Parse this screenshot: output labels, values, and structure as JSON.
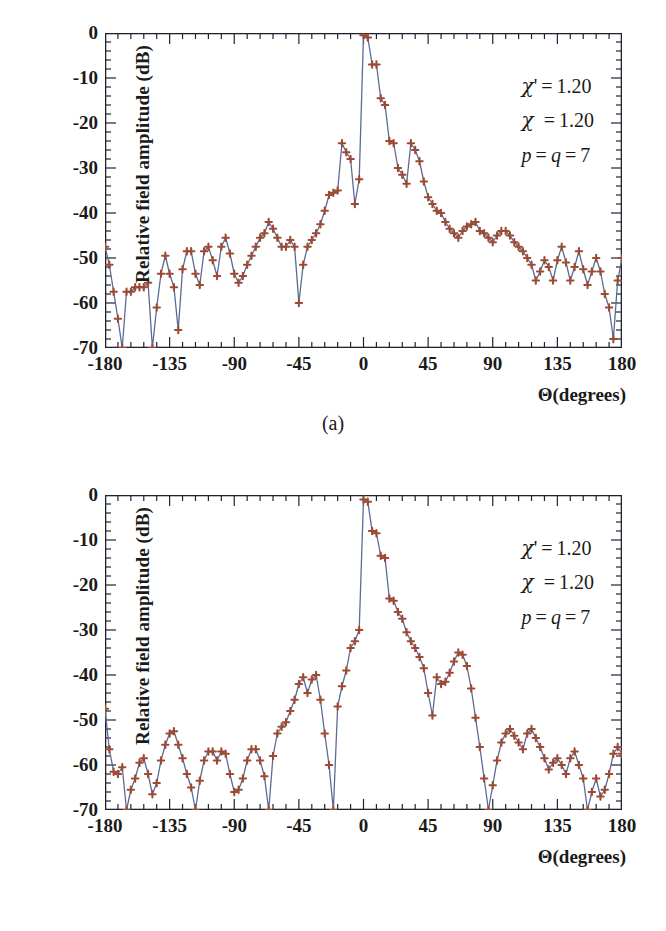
{
  "figure": {
    "axis": {
      "ylabel": "Relative field amplitude (dB)",
      "xlabel": "Θ(degrees)",
      "yticks": [
        "0",
        "-10",
        "-20",
        "-30",
        "-40",
        "-50",
        "-60",
        "-70"
      ],
      "ytick_values": [
        0,
        -10,
        -20,
        -30,
        -40,
        -50,
        -60,
        -70
      ],
      "xticks": [
        "-180",
        "-135",
        "-90",
        "-45",
        "0",
        "45",
        "90",
        "135",
        "180"
      ],
      "xtick_values": [
        -180,
        -135,
        -90,
        -45,
        0,
        45,
        90,
        135,
        180
      ],
      "ylim": [
        -70,
        0
      ],
      "xlim": [
        -180,
        180
      ],
      "y_minor_step": 2,
      "x_minor_step": 9
    },
    "style": {
      "marker_color": "#9c4a33",
      "line_color": "#5a6b96",
      "frame_color": "#1f2430",
      "background": "#ffffff"
    },
    "panels": [
      {
        "id": "a",
        "caption": "(a)",
        "annotations": [
          "χ' = 1.20",
          "χ  = 1.20",
          "p = q = 7"
        ],
        "annotation_parts": [
          {
            "sym": "χ'",
            "eq": "=",
            "val": "1.20"
          },
          {
            "sym": "χ ",
            "eq": "=",
            "val": "1.20"
          },
          {
            "sym": "p = q",
            "eq": "=",
            "val": "7"
          }
        ]
      },
      {
        "id": "b",
        "caption": "(b)",
        "annotations": [
          "χ' = 1.20",
          "χ  = 1.20",
          "p = q = 7"
        ],
        "annotation_parts": [
          {
            "sym": "χ'",
            "eq": "=",
            "val": "1.20"
          },
          {
            "sym": "χ ",
            "eq": "=",
            "val": "1.20"
          },
          {
            "sym": "p = q",
            "eq": "=",
            "val": "7"
          }
        ]
      }
    ]
  },
  "chart_data": [
    {
      "type": "line",
      "id": "panel-a",
      "title": "",
      "subtitle": "(a)",
      "xlabel": "Θ(degrees)",
      "ylabel": "Relative field amplitude (dB)",
      "xlim": [
        -180,
        180
      ],
      "ylim": [
        -70,
        0
      ],
      "grid": false,
      "legend": null,
      "markers": "plus",
      "annotations": [
        "χ' = 1.20",
        "χ = 1.20",
        "p = q = 7"
      ],
      "x": [
        -180,
        -177,
        -174,
        -171,
        -168,
        -165,
        -162,
        -159,
        -156,
        -153,
        -150,
        -147,
        -144,
        -141,
        -138,
        -135,
        -132,
        -129,
        -126,
        -123,
        -120,
        -117,
        -114,
        -111,
        -108,
        -105,
        -102,
        -99,
        -96,
        -93,
        -90,
        -87,
        -84,
        -81,
        -78,
        -75,
        -72,
        -69,
        -66,
        -63,
        -60,
        -57,
        -54,
        -51,
        -48,
        -45,
        -42,
        -39,
        -36,
        -33,
        -30,
        -27,
        -24,
        -21,
        -18,
        -15,
        -12,
        -9,
        -6,
        -3,
        0,
        3,
        6,
        9,
        12,
        15,
        18,
        21,
        24,
        27,
        30,
        33,
        36,
        39,
        42,
        45,
        48,
        51,
        54,
        57,
        60,
        63,
        66,
        69,
        72,
        75,
        78,
        81,
        84,
        87,
        90,
        93,
        96,
        99,
        102,
        105,
        108,
        111,
        114,
        117,
        120,
        123,
        126,
        129,
        132,
        135,
        138,
        141,
        144,
        147,
        150,
        153,
        156,
        159,
        162,
        165,
        168,
        171,
        174,
        177,
        180
      ],
      "y": [
        -47.5,
        -51.5,
        -57.5,
        -63.5,
        -70,
        -57.5,
        -57.5,
        -56.5,
        -56.5,
        -56.5,
        -55.5,
        -70,
        -61,
        -53.5,
        -49.5,
        -53.5,
        -56.5,
        -66,
        -52.5,
        -48.5,
        -48.5,
        -53.5,
        -56,
        -48.5,
        -47.5,
        -50.5,
        -54,
        -47.5,
        -45.5,
        -49,
        -53.5,
        -55.5,
        -54,
        -51.5,
        -49.5,
        -47.5,
        -45.5,
        -44.5,
        -42,
        -43.5,
        -45.5,
        -47.5,
        -47.5,
        -46,
        -47.5,
        -60,
        -51.5,
        -47.5,
        -46,
        -44.5,
        -42.5,
        -39.5,
        -36,
        -35.5,
        -35,
        -24.5,
        -26.5,
        -28,
        -38,
        -32.5,
        -0.5,
        -1,
        -7,
        -7,
        -14.5,
        -16,
        -24,
        -24.5,
        -30,
        -31.5,
        -33.5,
        -24.5,
        -26,
        -28.5,
        -33,
        -36.5,
        -38,
        -39.5,
        -40,
        -42,
        -43.5,
        -44.5,
        -45.5,
        -44,
        -43,
        -42.5,
        -42,
        -44,
        -44.5,
        -45.5,
        -46.5,
        -45,
        -44,
        -44,
        -45,
        -46.5,
        -47.5,
        -48.5,
        -50,
        -51.5,
        -55,
        -53,
        -50.5,
        -52,
        -55,
        -50.5,
        -47.5,
        -51,
        -55,
        -52,
        -48.5,
        -52.5,
        -56,
        -53,
        -50,
        -53,
        -58,
        -61,
        -68,
        -55,
        -50,
        -47.5
      ],
      "note": "Panel (a): main lobe peak 0 dB at 0°; first sidelobes about -24 dB near ±15-20°; far sidelobes oscillate between about -42 and -60 dB; deep nulls reach -70 dB near ±168° and -147°."
    },
    {
      "type": "line",
      "id": "panel-b",
      "title": "",
      "subtitle": "(b)",
      "xlabel": "Θ(degrees)",
      "ylabel": "Relative field amplitude (dB)",
      "xlim": [
        -180,
        180
      ],
      "ylim": [
        -70,
        0
      ],
      "grid": false,
      "legend": null,
      "markers": "plus",
      "annotations": [
        "χ' = 1.20",
        "χ = 1.20",
        "p = q = 7"
      ],
      "x": [
        -180,
        -177,
        -174,
        -171,
        -168,
        -165,
        -162,
        -159,
        -156,
        -153,
        -150,
        -147,
        -144,
        -141,
        -138,
        -135,
        -132,
        -129,
        -126,
        -123,
        -120,
        -117,
        -114,
        -111,
        -108,
        -105,
        -102,
        -99,
        -96,
        -93,
        -90,
        -87,
        -84,
        -81,
        -78,
        -75,
        -72,
        -69,
        -66,
        -63,
        -60,
        -57,
        -54,
        -51,
        -48,
        -45,
        -42,
        -39,
        -36,
        -33,
        -30,
        -27,
        -24,
        -21,
        -18,
        -15,
        -12,
        -9,
        -6,
        -3,
        0,
        3,
        6,
        9,
        12,
        15,
        18,
        21,
        24,
        27,
        30,
        33,
        36,
        39,
        42,
        45,
        48,
        51,
        54,
        57,
        60,
        63,
        66,
        69,
        72,
        75,
        78,
        81,
        84,
        87,
        90,
        93,
        96,
        99,
        102,
        105,
        108,
        111,
        114,
        117,
        120,
        123,
        126,
        129,
        132,
        135,
        138,
        141,
        144,
        147,
        150,
        153,
        156,
        159,
        162,
        165,
        168,
        171,
        174,
        177,
        180
      ],
      "y": [
        -47.5,
        -56.5,
        -61.5,
        -62,
        -60.5,
        -70,
        -65.5,
        -63,
        -59.5,
        -58.5,
        -62,
        -66.5,
        -64,
        -59,
        -55.5,
        -53,
        -52.5,
        -55.5,
        -58.5,
        -62,
        -65,
        -70,
        -63.5,
        -59,
        -57,
        -57,
        -59,
        -57,
        -57.5,
        -62,
        -66,
        -65.5,
        -63,
        -59,
        -56.5,
        -56.5,
        -59,
        -62.5,
        -70,
        -58,
        -53,
        -51.5,
        -50.5,
        -48,
        -45.5,
        -42,
        -40.5,
        -44,
        -41,
        -40,
        -45.5,
        -53,
        -60,
        -70,
        -47,
        -42.5,
        -39,
        -34,
        -32.5,
        -30,
        -1,
        -1.5,
        -8,
        -8.5,
        -13.5,
        -14,
        -23,
        -23.5,
        -26,
        -27.5,
        -30.5,
        -32.5,
        -34,
        -36,
        -38.5,
        -44,
        -49,
        -40.5,
        -42,
        -41.5,
        -39.5,
        -37,
        -35,
        -35.5,
        -38,
        -43,
        -49.5,
        -56,
        -63,
        -70,
        -64.5,
        -59,
        -55,
        -53,
        -52,
        -53.5,
        -55,
        -56.5,
        -53,
        -52,
        -54,
        -56,
        -58.5,
        -61,
        -59.5,
        -58.5,
        -60,
        -62,
        -58.5,
        -57,
        -60,
        -63,
        -70,
        -66,
        -63,
        -67,
        -65.5,
        -62,
        -57.5,
        -56,
        -57.5,
        -47.5
      ],
      "note": "Panel (b): main lobe peak 0 dB at 0°, narrower than (a); first sidelobes about -23 dB; mid sidelobes near ±40° about -35 to -42 dB; far sidelobes lower, between about -52 and -70 dB, with several nulls reaching -70 dB."
    }
  ]
}
